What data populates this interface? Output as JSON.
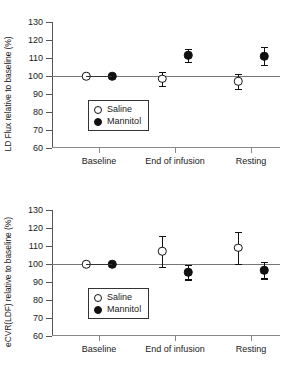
{
  "figure": {
    "background": "#ffffff",
    "ink_color": "#111111",
    "axis_color": "#555555",
    "reference_line_color": "#777777"
  },
  "chart_data": [
    {
      "type": "scatter",
      "panel": "top",
      "title": "",
      "xlabel": "",
      "ylabel": "LD Flux relative to baseline (%)",
      "categories": [
        "Baseline",
        "End of infusion",
        "Resting"
      ],
      "ylim": [
        60,
        130
      ],
      "yticks": [
        60,
        70,
        80,
        90,
        100,
        110,
        120,
        130
      ],
      "ytick_labels": [
        "60",
        "70",
        "80",
        "90",
        "100",
        "110",
        "120",
        "130"
      ],
      "grid": false,
      "reference_line": 100,
      "legend_position": "lower-left-inside",
      "series": [
        {
          "name": "Saline",
          "marker": "open-circle",
          "values": [
            100,
            98.5,
            97
          ],
          "errors": [
            0,
            4,
            4
          ]
        },
        {
          "name": "Mannitol",
          "marker": "filled-circle",
          "values": [
            100,
            111.5,
            111
          ],
          "errors": [
            0,
            3.5,
            5
          ]
        }
      ]
    },
    {
      "type": "scatter",
      "panel": "bottom",
      "title": "",
      "xlabel": "",
      "ylabel": "eCVR(LDF) relative to baseline (%)",
      "categories": [
        "Baseline",
        "End of infusion",
        "Resting"
      ],
      "ylim": [
        60,
        130
      ],
      "yticks": [
        60,
        70,
        80,
        90,
        100,
        110,
        120,
        130
      ],
      "ytick_labels": [
        "60",
        "70",
        "80",
        "90",
        "100",
        "110",
        "120",
        "130"
      ],
      "grid": false,
      "reference_line": 100,
      "legend_position": "lower-left-inside",
      "series": [
        {
          "name": "Saline",
          "marker": "open-circle",
          "values": [
            100,
            107,
            109
          ],
          "errors": [
            0,
            8.5,
            9
          ]
        },
        {
          "name": "Mannitol",
          "marker": "filled-circle",
          "values": [
            100,
            95.5,
            96.5
          ],
          "errors": [
            0,
            4,
            4.5
          ]
        }
      ]
    }
  ]
}
